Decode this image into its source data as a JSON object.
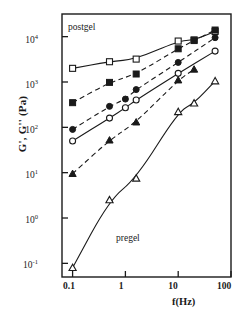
{
  "chart_data": {
    "type": "line",
    "title": "",
    "xlabel": "f(Hz)",
    "ylabel": "G', G'' (Pa)",
    "xscale": "log",
    "yscale": "log",
    "xlim": [
      0.063,
      100
    ],
    "ylim": [
      0.05,
      31600
    ],
    "grid": false,
    "legend": "none",
    "xticks": [
      "0.1",
      "1",
      "10",
      "100"
    ],
    "xtick_values": [
      0.1,
      1,
      10,
      100
    ],
    "yticks": [
      "10-1",
      "100",
      "101",
      "102",
      "103",
      "104"
    ],
    "ytick_exponents": [
      -1,
      0,
      1,
      2,
      3,
      4
    ],
    "ytick_values": [
      0.1,
      1,
      10,
      100,
      1000,
      10000
    ],
    "annotations": [
      {
        "text": "postgel",
        "x": 0.2,
        "y": 12000
      },
      {
        "text": "pregel",
        "x": 2.2,
        "y": 1.7
      }
    ],
    "series": [
      {
        "name": "postgel G' (open square)",
        "marker": "open-square",
        "line": "solid",
        "x": [
          0.1,
          0.5,
          1.6,
          10,
          20,
          50
        ],
        "y": [
          2000,
          2800,
          3200,
          8000,
          8500,
          13000
        ]
      },
      {
        "name": "postgel G'' (filled square)",
        "marker": "filled-square",
        "line": "dashed",
        "x": [
          0.1,
          0.5,
          1.6,
          10,
          20,
          50
        ],
        "y": [
          350,
          980,
          1500,
          5400,
          8200,
          14000
        ]
      },
      {
        "name": "intermediate G' (filled circle)",
        "marker": "filled-circle",
        "line": "dashed",
        "x": [
          0.1,
          0.5,
          1.0,
          1.6,
          10,
          50
        ],
        "y": [
          90,
          290,
          420,
          680,
          2700,
          9500
        ]
      },
      {
        "name": "intermediate G'' (open circle)",
        "marker": "open-circle",
        "line": "solid",
        "x": [
          0.1,
          0.5,
          1.0,
          1.6,
          10,
          50
        ],
        "y": [
          50,
          160,
          270,
          400,
          1550,
          4800
        ]
      },
      {
        "name": "pregel G' (filled triangle)",
        "marker": "filled-triangle",
        "line": "dashed",
        "x": [
          0.1,
          0.5,
          1.6,
          10,
          20
        ],
        "y": [
          9.5,
          52,
          130,
          1100,
          1900
        ]
      },
      {
        "name": "pregel G'' (open triangle)",
        "marker": "open-triangle",
        "line": "solid",
        "x": [
          0.1,
          0.5,
          1.6,
          10,
          20,
          50
        ],
        "y": [
          0.08,
          2.5,
          7.5,
          220,
          340,
          1050
        ]
      }
    ]
  },
  "axis_label_y": "G', G'' (Pa)",
  "axis_label_x": "f(Hz)"
}
